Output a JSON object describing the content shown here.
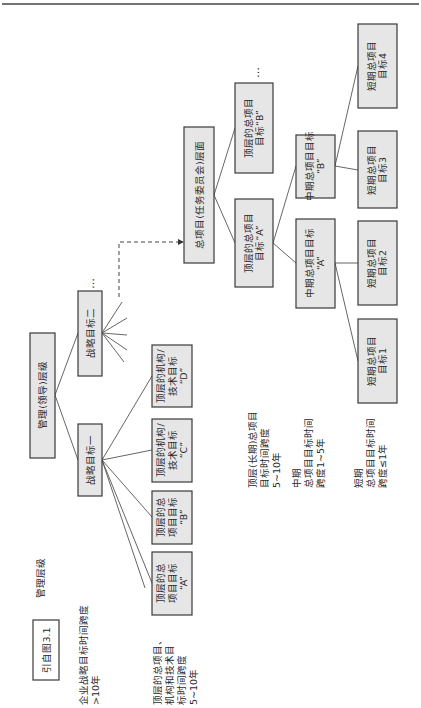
{
  "figure": {
    "orientation": "rotated 90° counter-clockwise",
    "reference_label": "引自图3.1",
    "level_heading": "管理层级",
    "ellipsis": "…"
  },
  "management": {
    "root": "管理(领导)层级",
    "strategic_goal_1": "战略目标一",
    "strategic_goal_2": "战略目标二",
    "top_goals": [
      {
        "lines": [
          "顶层的总",
          "项目目标",
          "“A”"
        ]
      },
      {
        "lines": [
          "顶层的总",
          "项目目标",
          "“B”"
        ]
      },
      {
        "lines": [
          "顶层的机构/",
          "技术目标",
          "“C”"
        ]
      },
      {
        "lines": [
          "顶层的机构/",
          "技术目标",
          "“D”"
        ]
      }
    ]
  },
  "program": {
    "root": "总项目(任务委员会)层面",
    "top": [
      {
        "lines": [
          "顶层的总项目",
          "目标“A”"
        ]
      },
      {
        "lines": [
          "顶层的总项目",
          "目标“B”"
        ]
      }
    ],
    "mid": [
      {
        "lines": [
          "中期总项目目标",
          "“A”"
        ]
      },
      {
        "lines": [
          "中期总项目目标",
          "“B”"
        ]
      }
    ],
    "short": [
      {
        "lines": [
          "短期总项目",
          "目标1"
        ]
      },
      {
        "lines": [
          "短期总项目",
          "目标2"
        ]
      },
      {
        "lines": [
          "短期总项目",
          "目标3"
        ]
      },
      {
        "lines": [
          "短期总项目",
          "目标4"
        ]
      }
    ]
  },
  "annotations": {
    "enterprise": [
      "企业战略目标时间跨度",
      ">10年"
    ],
    "top_mgmt": [
      "顶层的总项目、",
      "机构和技术目",
      "标时间跨度",
      "5~10年"
    ],
    "top_program": [
      "顶层(长期)总项目",
      "目标时间跨度",
      "5~10年"
    ],
    "mid_program": [
      "中期",
      "总项目目标时间",
      "跨度1~5年"
    ],
    "short_program": [
      "短期",
      "总项目目标时间",
      "跨度≤1年"
    ]
  }
}
